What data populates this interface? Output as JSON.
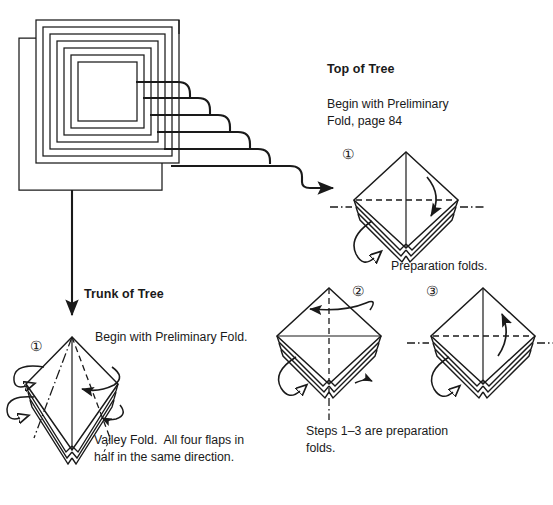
{
  "page": {
    "background_color": "#ffffff",
    "ink_color": "#1a1a1a"
  },
  "sections": {
    "top_of_tree": {
      "heading": "Top of Tree",
      "instruction_line1": "Begin with Preliminary",
      "instruction_line2": "Fold, page 84",
      "page_reference": "84",
      "step1_number": "①",
      "step2_number": "②",
      "step3_number": "③",
      "caption_step1": "Preparation folds.",
      "caption_steps_line1": "Steps 1–3 are preparation",
      "caption_steps_line2": "folds."
    },
    "trunk_of_tree": {
      "heading": "Trunk of Tree",
      "step1_number": "①",
      "instruction": "Begin with Preliminary Fold.",
      "caption_line1": "Valley Fold.  All four flaps in",
      "caption_line2": "half in the same direction."
    }
  },
  "icons": {
    "stacked_squares": "nested-squares-paper-stack",
    "connector_right": "right-arrow-connector",
    "connector_down": "down-arrow-connector",
    "fold_arrow": "curved-fold-arrow",
    "turn_over_arrow": "loop-turn-arrow"
  }
}
